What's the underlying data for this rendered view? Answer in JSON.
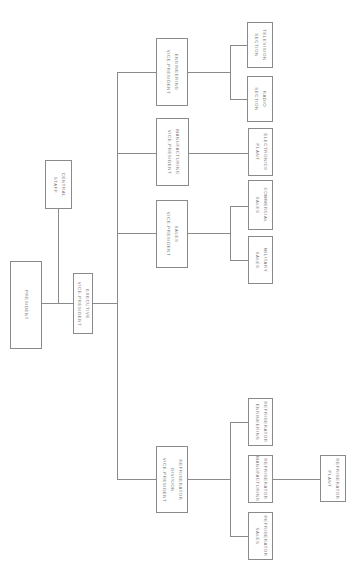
{
  "chart": {
    "type": "org-chart",
    "orientation": "rotated-90-clockwise",
    "line_color": "#8a8a8a",
    "text_color": "#777777"
  },
  "nodes": {
    "president": {
      "lines": [
        "PRESIDENT"
      ]
    },
    "central_staff": {
      "lines": [
        "CENTRAL",
        "STAFF"
      ]
    },
    "exec_vp": {
      "lines": [
        "EXECUTIVE",
        "VICE-PRESIDENT"
      ]
    },
    "eng_vp": {
      "lines": [
        "ENGINEERING",
        "VICE-PRESIDENT"
      ]
    },
    "mfg_vp": {
      "lines": [
        "MANUFACTURING",
        "VICE-PRESIDENT"
      ]
    },
    "sales_vp": {
      "lines": [
        "SALES",
        "VICE-PRESIDENT"
      ]
    },
    "refrig_div": {
      "lines": [
        "REFRIGERATOR",
        "DIVISION",
        "VICE-PRESIDENT"
      ]
    },
    "tv_section": {
      "lines": [
        "TELEVISION",
        "SECTION"
      ]
    },
    "radio_section": {
      "lines": [
        "RADIO",
        "SECTION"
      ]
    },
    "electronics_plant": {
      "lines": [
        "ELECTRONICS",
        "PLANT"
      ]
    },
    "commercial_sales": {
      "lines": [
        "COMMERCIAL",
        "SALES"
      ]
    },
    "military_sales": {
      "lines": [
        "MILITARY",
        "SALES"
      ]
    },
    "refrig_engineering": {
      "lines": [
        "REFRIGERATOR",
        "ENGINEERING"
      ]
    },
    "refrig_manufacturing": {
      "lines": [
        "REFRIGERATOR",
        "MANUFACTURING"
      ]
    },
    "refrig_sales": {
      "lines": [
        "REFRIGERATOR",
        "SALES"
      ]
    },
    "refrig_plant": {
      "lines": [
        "REFRIGERATOR",
        "PLANT"
      ]
    }
  }
}
